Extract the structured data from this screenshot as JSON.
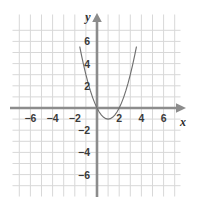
{
  "chart_data": {
    "type": "line",
    "title": "",
    "subtitle": "",
    "xlabel": "x",
    "ylabel": "y",
    "xlim": [
      -7.5,
      7.5
    ],
    "ylim": [
      -7.5,
      7.5
    ],
    "grid": true,
    "grid_step": 1,
    "legend": "none",
    "equation": "y = x^2 - 2x",
    "curve_shape": "parabola",
    "vertex": [
      1,
      -1
    ],
    "x_intercepts": [
      0,
      2
    ],
    "y_intercept": 0,
    "x_ticks": [
      -6,
      -4,
      -2,
      2,
      4,
      6
    ],
    "x_tick_labels": [
      "−6",
      "−4",
      "−2",
      "2",
      "4",
      "6"
    ],
    "y_ticks": [
      6,
      4,
      2,
      -2,
      -4,
      -6
    ],
    "y_tick_labels": [
      "6",
      "4",
      "2",
      "−2",
      "−4",
      "−6"
    ],
    "series": [
      {
        "name": "y = x^2 - 2x",
        "x": [
          -1.55,
          -1.4,
          -1.2,
          -1.0,
          -0.8,
          -0.6,
          -0.4,
          -0.2,
          0.0,
          0.2,
          0.4,
          0.6,
          0.8,
          1.0,
          1.2,
          1.4,
          1.6,
          1.8,
          2.0,
          2.2,
          2.4,
          2.6,
          2.8,
          3.0,
          3.2,
          3.4,
          3.55
        ],
        "y": [
          5.5,
          4.76,
          3.84,
          3.0,
          2.24,
          1.56,
          0.96,
          0.44,
          0.0,
          -0.36,
          -0.64,
          -0.84,
          -0.96,
          -1.0,
          -0.96,
          -0.84,
          -0.64,
          -0.36,
          0.0,
          0.44,
          0.96,
          1.56,
          2.24,
          3.0,
          3.84,
          4.76,
          5.5
        ]
      }
    ],
    "colors": {
      "curve": "#6f6f6f",
      "axis": "#8c8c8c",
      "grid": "#d8d8d8",
      "label": "#3a3a3a",
      "background": "#ffffff"
    }
  },
  "axes": {
    "x_axis_name": "x",
    "y_axis_name": "y"
  }
}
